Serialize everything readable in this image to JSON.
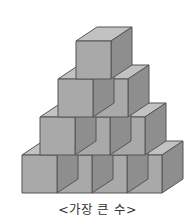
{
  "figure": {
    "caption": "<가장 큰 수>",
    "rows": [
      {
        "level": 1,
        "cubes": 1
      },
      {
        "level": 2,
        "cubes": 2
      },
      {
        "level": 3,
        "cubes": 3
      },
      {
        "level": 4,
        "cubes": 4
      }
    ],
    "total_visible_cubes": 10
  },
  "colors": {
    "top_face": "#c2c2c2",
    "front_face": "#a9a9a9",
    "side_face": "#8e8e8e",
    "edge": "#555555",
    "background": "#ffffff"
  }
}
